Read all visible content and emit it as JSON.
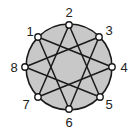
{
  "diagram": {
    "type": "star-polygon",
    "colors": {
      "fill": "#c8c8c8",
      "stroke": "#1a1a1a",
      "node_fill": "#ffffff",
      "label": "#222222"
    },
    "circle": {
      "cx": 69,
      "cy": 67,
      "r": 43
    },
    "nodes": [
      {
        "id": "1",
        "label": "1",
        "x": 38,
        "y": 37,
        "lx": 30,
        "ly": 36
      },
      {
        "id": "2",
        "label": "2",
        "x": 69,
        "y": 25,
        "lx": 69,
        "ly": 17
      },
      {
        "id": "3",
        "label": "3",
        "x": 99,
        "y": 37,
        "lx": 109,
        "ly": 35
      },
      {
        "id": "4",
        "label": "4",
        "x": 112,
        "y": 67,
        "lx": 124,
        "ly": 72
      },
      {
        "id": "5",
        "label": "5",
        "x": 100,
        "y": 97,
        "lx": 109,
        "ly": 109
      },
      {
        "id": "6",
        "label": "6",
        "x": 69,
        "y": 109,
        "lx": 69,
        "ly": 127
      },
      {
        "id": "7",
        "label": "7",
        "x": 38,
        "y": 97,
        "lx": 26,
        "ly": 109
      },
      {
        "id": "8",
        "label": "8",
        "x": 25,
        "y": 67,
        "lx": 14,
        "ly": 72
      }
    ],
    "edges": [
      [
        "1",
        "4"
      ],
      [
        "4",
        "7"
      ],
      [
        "7",
        "2"
      ],
      [
        "2",
        "5"
      ],
      [
        "5",
        "8"
      ],
      [
        "8",
        "3"
      ],
      [
        "3",
        "6"
      ],
      [
        "6",
        "1"
      ]
    ]
  }
}
